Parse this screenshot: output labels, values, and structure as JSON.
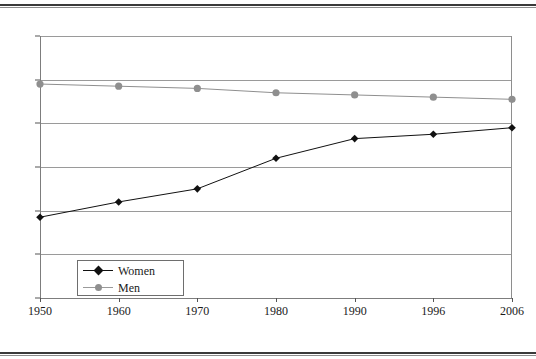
{
  "chart_data": {
    "type": "line",
    "title": "",
    "subtitle": "",
    "xlabel": "",
    "ylabel": "",
    "categories": [
      "1950",
      "1960",
      "1970",
      "1980",
      "1990",
      "1996",
      "2006"
    ],
    "ylim": [
      0,
      120
    ],
    "ytick_values": [
      0,
      20,
      40,
      60,
      80,
      100,
      120
    ],
    "ytick_labels": [
      "0",
      "20",
      "40",
      "60",
      "80",
      "100",
      "120"
    ],
    "grid": "horizontal",
    "legend_position": "inside-bottom-left",
    "series": [
      {
        "name": "Women",
        "color": "#111111",
        "marker": "diamond",
        "values": [
          37,
          44,
          50,
          64,
          73,
          75,
          78
        ]
      },
      {
        "name": "Men",
        "color": "#8f8f8f",
        "marker": "circle",
        "values": [
          98,
          97,
          96,
          94,
          93,
          92,
          91
        ]
      }
    ]
  },
  "legend": {
    "entries": [
      {
        "label": "Women"
      },
      {
        "label": "Men"
      }
    ]
  }
}
